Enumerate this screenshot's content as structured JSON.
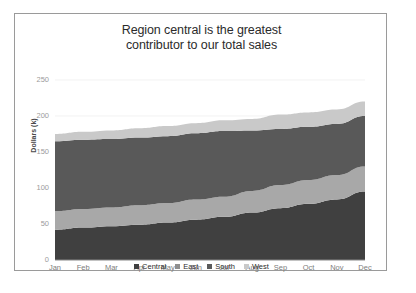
{
  "card": {
    "title_line1": "Region central is the greatest",
    "title_line2": "contributor to our total sales"
  },
  "axis": {
    "y_title": "Dollars (k)",
    "y_ticks": [
      "0",
      "50",
      "100",
      "150",
      "200",
      "250"
    ],
    "x_ticks": [
      "Jan",
      "Feb",
      "Mar",
      "Apr",
      "May",
      "Jun",
      "Jul",
      "Aug",
      "Sep",
      "Oct",
      "Nov",
      "Dec"
    ]
  },
  "legend": {
    "items": [
      {
        "label": "Central",
        "color": "#404040"
      },
      {
        "label": "East",
        "color": "#8f8f8f"
      },
      {
        "label": "South",
        "color": "#5a5a5a"
      },
      {
        "label": "West",
        "color": "#c9c9c9"
      }
    ]
  },
  "chart_data": {
    "type": "area",
    "title": "Region central is the greatest contributor to our total sales",
    "xlabel": "",
    "ylabel": "Dollars (k)",
    "ylim": [
      0,
      250
    ],
    "yticks": [
      0,
      50,
      100,
      150,
      200,
      250
    ],
    "grid": true,
    "stacked": true,
    "legend_position": "bottom",
    "categories": [
      "Jan",
      "Feb",
      "Mar",
      "Apr",
      "May",
      "Jun",
      "Jul",
      "Aug",
      "Sep",
      "Oct",
      "Nov",
      "Dec"
    ],
    "series": [
      {
        "name": "Central",
        "color": "#404040",
        "values": [
          42,
          45,
          47,
          49,
          52,
          56,
          60,
          66,
          72,
          78,
          84,
          95
        ]
      },
      {
        "name": "South",
        "color": "#a8a8a8",
        "values": [
          26,
          26,
          26,
          27,
          27,
          28,
          28,
          30,
          32,
          33,
          34,
          35
        ]
      },
      {
        "name": "East",
        "color": "#595959",
        "values": [
          97,
          96,
          95,
          94,
          93,
          92,
          91,
          84,
          78,
          74,
          71,
          70
        ]
      },
      {
        "name": "West",
        "color": "#c9c9c9",
        "values": [
          10,
          11,
          12,
          13,
          14,
          14,
          15,
          16,
          20,
          20,
          20,
          20
        ]
      }
    ],
    "cumulative_totals": [
      175,
      178,
      180,
      183,
      186,
      190,
      194,
      196,
      202,
      205,
      209,
      220
    ]
  },
  "plot_geometry": {
    "left": 40,
    "right": 350,
    "top": 66,
    "bottom": 246,
    "y_min": 0,
    "y_max": 250
  }
}
